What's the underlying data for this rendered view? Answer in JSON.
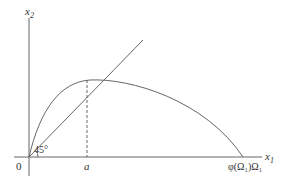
{
  "diagram": {
    "y_axis_label": "x",
    "y_axis_sub": "2",
    "x_axis_label": "x",
    "x_axis_sub": "1",
    "origin_label": "0",
    "angle_label": "45°",
    "a_label": "a",
    "x_end_label": "φ(Ω₁)Ω₁",
    "colors": {
      "line": "#666666",
      "text": "#333333"
    }
  }
}
